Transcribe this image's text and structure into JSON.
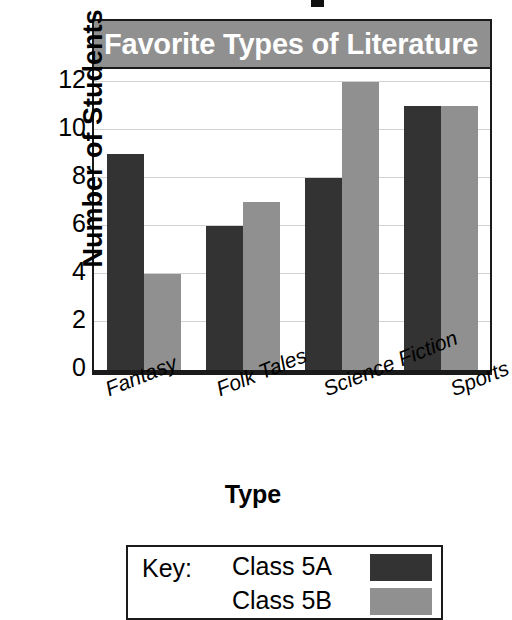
{
  "chart_data": {
    "type": "bar",
    "title": "Favorite Types of Literature",
    "xlabel": "Type",
    "ylabel": "Number of Students",
    "categories": [
      "Fantasy",
      "Folk Tales",
      "Science Fiction",
      "Sports"
    ],
    "series": [
      {
        "name": "Class 5A",
        "values": [
          9,
          6,
          8,
          11
        ],
        "color": "#333333"
      },
      {
        "name": "Class 5B",
        "values": [
          4,
          7,
          12,
          11
        ],
        "color": "#909090"
      }
    ],
    "ylim": [
      0,
      13
    ],
    "yticks": [
      0,
      2,
      4,
      6,
      8,
      10,
      12
    ],
    "ytick_labels": [
      "0",
      "2",
      "4",
      "6",
      "8",
      "10",
      "12"
    ],
    "grid": true,
    "grid_axis": "y",
    "legend_position": "below-plot",
    "legend_title": "Key:",
    "title_band_color": "#909090",
    "title_text_color": "#ffffff",
    "axis_color": "#1a1a1a",
    "gridline_color": "#d2d2d2"
  },
  "legend": {
    "key_label": "Key:",
    "entries": [
      {
        "label": "Class 5A",
        "swatch": "series-a"
      },
      {
        "label": "Class 5B",
        "swatch": "series-b"
      }
    ]
  }
}
